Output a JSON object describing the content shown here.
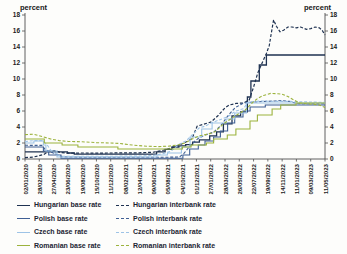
{
  "chart_data": {
    "type": "line",
    "title": "",
    "ylabel_left": "percent",
    "ylabel_right": "percent",
    "ylim": [
      0,
      18
    ],
    "yticks": [
      0,
      2,
      4,
      6,
      8,
      10,
      12,
      14,
      16,
      18
    ],
    "grid": false,
    "legend_position": "bottom",
    "axis_color": "#4f4f4f",
    "text_color": "#1a1a1a",
    "x_tick_labels": [
      "02/01/2020",
      "28/02/2020",
      "27/04/2020",
      "23/06/2020",
      "19/08/2020",
      "15/10/2020",
      "11/12/2020",
      "08/02/2021",
      "12/04/2021",
      "09/06/2021",
      "05/08/2021",
      "04/10/2021",
      "01/12/2021",
      "27/01/2022",
      "28/03/2022",
      "26/05/2022",
      "22/07/2022",
      "19/09/2022",
      "14/11/2022",
      "11/01/2023",
      "09/03/2023",
      "11/05/2023"
    ],
    "x_unit": "tick-index (0 = 02/01/2020, 21 = 11/05/2023)",
    "y_unit": "percent",
    "series": [
      {
        "id": "hungarian-base-rate",
        "name": "Hungarian base rate",
        "color": "#1f3251",
        "dash": "solid",
        "width": 1.3,
        "points": [
          [
            0,
            0.9
          ],
          [
            2.97,
            0.9
          ],
          [
            2.97,
            0.75
          ],
          [
            3.45,
            0.75
          ],
          [
            3.45,
            0.6
          ],
          [
            9.21,
            0.6
          ],
          [
            9.21,
            0.9
          ],
          [
            9.81,
            0.9
          ],
          [
            9.81,
            1.2
          ],
          [
            10.29,
            1.2
          ],
          [
            10.29,
            1.5
          ],
          [
            10.77,
            1.5
          ],
          [
            10.77,
            1.65
          ],
          [
            11.25,
            1.65
          ],
          [
            11.25,
            1.8
          ],
          [
            11.73,
            1.8
          ],
          [
            11.73,
            2.1
          ],
          [
            12.21,
            2.1
          ],
          [
            12.21,
            2.4
          ],
          [
            12.93,
            2.4
          ],
          [
            12.93,
            2.9
          ],
          [
            13.41,
            2.9
          ],
          [
            13.41,
            3.4
          ],
          [
            13.89,
            3.4
          ],
          [
            13.89,
            4.4
          ],
          [
            14.49,
            4.4
          ],
          [
            14.49,
            5.4
          ],
          [
            15.09,
            5.4
          ],
          [
            15.09,
            5.9
          ],
          [
            15.57,
            5.9
          ],
          [
            15.57,
            7.75
          ],
          [
            15.81,
            7.75
          ],
          [
            15.81,
            9.75
          ],
          [
            16.4,
            9.75
          ],
          [
            16.4,
            11.75
          ],
          [
            16.9,
            11.75
          ],
          [
            16.9,
            13
          ],
          [
            21,
            13
          ]
        ]
      },
      {
        "id": "hungarian-interbank-rate",
        "name": "Hungarian interbank rate",
        "color": "#1f3251",
        "dash": "dashed",
        "width": 1.2,
        "points": [
          [
            0,
            0.16
          ],
          [
            0.6,
            0.25
          ],
          [
            1.3,
            0.55
          ],
          [
            1.7,
            1.0
          ],
          [
            2.1,
            1.05
          ],
          [
            2.5,
            0.8
          ],
          [
            3,
            0.72
          ],
          [
            4,
            0.75
          ],
          [
            5,
            0.74
          ],
          [
            6,
            0.75
          ],
          [
            7,
            0.76
          ],
          [
            8,
            0.78
          ],
          [
            9,
            0.85
          ],
          [
            9.6,
            1.05
          ],
          [
            10.2,
            1.35
          ],
          [
            10.8,
            1.75
          ],
          [
            11.3,
            2.15
          ],
          [
            11.7,
            2.55
          ],
          [
            12.05,
            4.1
          ],
          [
            12.5,
            4.35
          ],
          [
            13,
            4.6
          ],
          [
            13.5,
            5.4
          ],
          [
            14,
            6.4
          ],
          [
            14.3,
            6.75
          ],
          [
            14.8,
            6.95
          ],
          [
            15.3,
            7.0
          ],
          [
            15.7,
            7.4
          ],
          [
            16,
            9.0
          ],
          [
            16.3,
            10.8
          ],
          [
            16.6,
            12.0
          ],
          [
            16.9,
            13.2
          ],
          [
            17.1,
            14.2
          ],
          [
            17.25,
            15.8
          ],
          [
            17.4,
            17.4
          ],
          [
            17.6,
            16.6
          ],
          [
            17.85,
            15.9
          ],
          [
            18.1,
            16.1
          ],
          [
            18.4,
            16.5
          ],
          [
            18.7,
            16.5
          ],
          [
            19,
            16.4
          ],
          [
            19.3,
            16.5
          ],
          [
            19.7,
            16.2
          ],
          [
            20,
            16.3
          ],
          [
            20.3,
            16.5
          ],
          [
            20.6,
            16.4
          ],
          [
            20.8,
            16.1
          ],
          [
            21,
            15.5
          ]
        ]
      },
      {
        "id": "polish-base-rate",
        "name": "Polish base rate",
        "color": "#3f5f94",
        "dash": "solid",
        "width": 1.1,
        "points": [
          [
            0,
            1.5
          ],
          [
            1.29,
            1.5
          ],
          [
            1.29,
            1.0
          ],
          [
            1.66,
            1.0
          ],
          [
            1.66,
            0.5
          ],
          [
            2.52,
            0.5
          ],
          [
            2.52,
            0.1
          ],
          [
            11.05,
            0.1
          ],
          [
            11.05,
            0.5
          ],
          [
            11.53,
            0.5
          ],
          [
            11.53,
            1.25
          ],
          [
            12.13,
            1.25
          ],
          [
            12.13,
            1.75
          ],
          [
            12.6,
            1.75
          ],
          [
            12.6,
            2.25
          ],
          [
            13.2,
            2.25
          ],
          [
            13.2,
            2.75
          ],
          [
            13.68,
            2.75
          ],
          [
            13.68,
            3.5
          ],
          [
            14.18,
            3.5
          ],
          [
            14.18,
            4.5
          ],
          [
            14.68,
            4.5
          ],
          [
            14.68,
            5.25
          ],
          [
            15.26,
            5.25
          ],
          [
            15.26,
            6.0
          ],
          [
            15.76,
            6.0
          ],
          [
            15.76,
            6.5
          ],
          [
            16.82,
            6.5
          ],
          [
            16.82,
            6.75
          ],
          [
            21,
            6.75
          ]
        ]
      },
      {
        "id": "polish-interbank-rate",
        "name": "Polish interbank rate",
        "color": "#3f5f94",
        "dash": "dashed",
        "width": 1.1,
        "points": [
          [
            0,
            1.71
          ],
          [
            1.2,
            1.7
          ],
          [
            1.4,
            1.2
          ],
          [
            1.7,
            0.95
          ],
          [
            2.2,
            0.6
          ],
          [
            2.6,
            0.27
          ],
          [
            4,
            0.23
          ],
          [
            6,
            0.21
          ],
          [
            8,
            0.21
          ],
          [
            10,
            0.22
          ],
          [
            10.8,
            0.25
          ],
          [
            11.1,
            0.65
          ],
          [
            11.6,
            1.75
          ],
          [
            12.1,
            2.55
          ],
          [
            12.6,
            3.0
          ],
          [
            13.2,
            3.35
          ],
          [
            13.7,
            4.15
          ],
          [
            14.2,
            5.4
          ],
          [
            14.7,
            6.4
          ],
          [
            15.3,
            7.0
          ],
          [
            15.8,
            7.1
          ],
          [
            16.8,
            7.2
          ],
          [
            17.5,
            7.25
          ],
          [
            18,
            7.3
          ],
          [
            18.5,
            7.2
          ],
          [
            19,
            6.95
          ],
          [
            19.5,
            6.9
          ],
          [
            20,
            6.9
          ],
          [
            20.5,
            6.9
          ],
          [
            21,
            6.9
          ]
        ]
      },
      {
        "id": "czech-base-rate",
        "name": "Czech base rate",
        "color": "#9dc3e6",
        "dash": "solid",
        "width": 1.1,
        "points": [
          [
            0,
            2.0
          ],
          [
            0.62,
            2.0
          ],
          [
            0.62,
            2.25
          ],
          [
            1.29,
            2.25
          ],
          [
            1.29,
            1.75
          ],
          [
            1.46,
            1.75
          ],
          [
            1.46,
            1.0
          ],
          [
            2.24,
            1.0
          ],
          [
            2.24,
            0.25
          ],
          [
            9.24,
            0.25
          ],
          [
            9.24,
            0.5
          ],
          [
            9.97,
            0.5
          ],
          [
            9.97,
            0.75
          ],
          [
            10.95,
            0.75
          ],
          [
            10.95,
            1.5
          ],
          [
            11.56,
            1.5
          ],
          [
            11.56,
            2.75
          ],
          [
            12.37,
            2.75
          ],
          [
            12.37,
            3.75
          ],
          [
            13.1,
            3.75
          ],
          [
            13.1,
            4.5
          ],
          [
            14.08,
            4.5
          ],
          [
            14.08,
            5.0
          ],
          [
            14.68,
            5.0
          ],
          [
            14.68,
            5.75
          ],
          [
            15.5,
            5.75
          ],
          [
            15.5,
            7.0
          ],
          [
            21,
            7.0
          ]
        ]
      },
      {
        "id": "czech-interbank-rate",
        "name": "Czech interbank rate",
        "color": "#9dc3e6",
        "dash": "dashed",
        "width": 1.1,
        "points": [
          [
            0,
            2.18
          ],
          [
            0.6,
            2.3
          ],
          [
            1.2,
            2.3
          ],
          [
            1.5,
            1.9
          ],
          [
            1.8,
            1.1
          ],
          [
            2.2,
            0.6
          ],
          [
            2.5,
            0.35
          ],
          [
            4,
            0.35
          ],
          [
            6,
            0.35
          ],
          [
            8,
            0.36
          ],
          [
            9,
            0.45
          ],
          [
            9.6,
            0.65
          ],
          [
            10.2,
            0.95
          ],
          [
            10.8,
            1.85
          ],
          [
            11.3,
            2.3
          ],
          [
            11.7,
            3.0
          ],
          [
            12.2,
            3.9
          ],
          [
            12.6,
            4.1
          ],
          [
            13.1,
            4.55
          ],
          [
            13.7,
            4.95
          ],
          [
            14.2,
            5.3
          ],
          [
            14.7,
            5.95
          ],
          [
            15.3,
            6.3
          ],
          [
            15.6,
            7.1
          ],
          [
            16.5,
            7.25
          ],
          [
            17.5,
            7.2
          ],
          [
            18.5,
            7.2
          ],
          [
            19.5,
            7.15
          ],
          [
            20.5,
            7.1
          ],
          [
            21,
            7.1
          ]
        ]
      },
      {
        "id": "romanian-base-rate",
        "name": "Romanian base rate",
        "color": "#9cb33d",
        "dash": "solid",
        "width": 1.1,
        "points": [
          [
            0,
            2.5
          ],
          [
            1.35,
            2.5
          ],
          [
            1.35,
            2.0
          ],
          [
            2.6,
            2.0
          ],
          [
            2.6,
            1.75
          ],
          [
            3.7,
            1.75
          ],
          [
            3.7,
            1.5
          ],
          [
            6.5,
            1.5
          ],
          [
            6.5,
            1.25
          ],
          [
            11.02,
            1.25
          ],
          [
            11.02,
            1.5
          ],
          [
            11.63,
            1.5
          ],
          [
            11.63,
            1.75
          ],
          [
            12.7,
            1.75
          ],
          [
            12.7,
            2.0
          ],
          [
            13.2,
            2.0
          ],
          [
            13.2,
            2.5
          ],
          [
            14.16,
            2.5
          ],
          [
            14.16,
            3.0
          ],
          [
            14.76,
            3.0
          ],
          [
            14.76,
            3.75
          ],
          [
            15.75,
            3.75
          ],
          [
            15.75,
            4.75
          ],
          [
            16.27,
            4.75
          ],
          [
            16.27,
            5.5
          ],
          [
            17.3,
            5.5
          ],
          [
            17.3,
            6.25
          ],
          [
            17.9,
            6.25
          ],
          [
            17.9,
            6.75
          ],
          [
            18.97,
            6.75
          ],
          [
            18.97,
            7.0
          ],
          [
            21,
            7.0
          ]
        ]
      },
      {
        "id": "romanian-interbank-rate",
        "name": "Romanian interbank rate",
        "color": "#9cb33d",
        "dash": "dashed",
        "width": 1.1,
        "points": [
          [
            0,
            3.05
          ],
          [
            0.6,
            3.1
          ],
          [
            1.3,
            2.75
          ],
          [
            1.8,
            2.5
          ],
          [
            2.4,
            2.3
          ],
          [
            3,
            2.2
          ],
          [
            4,
            2.15
          ],
          [
            5,
            2.05
          ],
          [
            6,
            2.0
          ],
          [
            6.6,
            1.95
          ],
          [
            7.5,
            1.75
          ],
          [
            8.5,
            1.6
          ],
          [
            9.3,
            1.55
          ],
          [
            10,
            1.6
          ],
          [
            10.7,
            1.75
          ],
          [
            11.2,
            2.0
          ],
          [
            11.7,
            2.5
          ],
          [
            12.2,
            2.9
          ],
          [
            12.8,
            3.1
          ],
          [
            13.3,
            3.4
          ],
          [
            13.9,
            4.4
          ],
          [
            14.4,
            5.0
          ],
          [
            14.9,
            5.6
          ],
          [
            15.4,
            6.1
          ],
          [
            15.9,
            7.0
          ],
          [
            16.3,
            7.6
          ],
          [
            16.7,
            7.95
          ],
          [
            17.2,
            8.2
          ],
          [
            17.7,
            8.15
          ],
          [
            18,
            8.1
          ],
          [
            18.4,
            7.8
          ],
          [
            18.8,
            7.4
          ],
          [
            19.2,
            7.0
          ],
          [
            19.7,
            6.9
          ],
          [
            20.2,
            6.85
          ],
          [
            20.6,
            6.75
          ],
          [
            21,
            6.45
          ]
        ]
      }
    ]
  }
}
